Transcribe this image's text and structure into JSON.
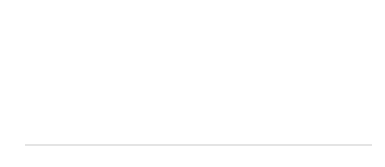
{
  "chart_data": {
    "type": "line",
    "title": "",
    "xlabel": "[年]",
    "ylabel": "[%]",
    "ylim": [
      0,
      16
    ],
    "yticks": [
      0,
      2,
      4,
      6,
      8,
      10,
      12,
      14,
      16
    ],
    "grid": true,
    "categories": [
      "1998",
      "2002",
      "2006",
      "2010",
      "2014"
    ],
    "series": [
      {
        "name": "旧東ドイツ",
        "style": "dashed",
        "marker": "open-circle",
        "values": [
          13.2,
          14.4,
          12.4,
          11.5,
          11.2
        ]
      },
      {
        "name": "ドイツ",
        "style": "solid",
        "marker": "filled-circle",
        "values": [
          7.5,
          8.2,
          8.1,
          8.6,
          8.0
        ]
      },
      {
        "name": "旧西ドイツ",
        "style": "dotted",
        "marker": "open-circle",
        "values": [
          6.1,
          6.7,
          6.8,
          7.8,
          7.1
        ]
      }
    ]
  },
  "labels": {
    "y_unit": "[%]",
    "x_unit": "[年]"
  }
}
